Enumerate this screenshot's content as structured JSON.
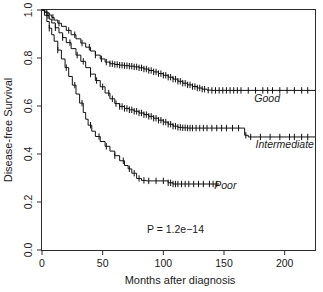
{
  "chart_data": {
    "type": "line",
    "title": "",
    "subtitle": "",
    "xlabel": "Months after diagnosis",
    "ylabel": "Disease-free Survival",
    "xlim": [
      0,
      225
    ],
    "ylim": [
      0.0,
      1.0
    ],
    "xticks": [
      0,
      50,
      100,
      150,
      200
    ],
    "xtick_labels": [
      "0",
      "50",
      "100",
      "150",
      "200"
    ],
    "yticks": [
      0.0,
      0.2,
      0.4,
      0.6,
      0.8,
      1.0
    ],
    "ytick_labels": [
      "0.0",
      "0.2",
      "0.4",
      "0.6",
      "0.8",
      "1.0"
    ],
    "grid": false,
    "legend_position": "inline-right-of-curve",
    "annotations": [
      {
        "name": "p-value",
        "text": "P = 1.2e−14",
        "x": 110,
        "y": 0.07
      }
    ],
    "series": [
      {
        "name": "Good",
        "label": "Good",
        "color": "#111111",
        "label_x": 175,
        "label_y": 0.615,
        "plateau_value": 0.665,
        "points": [
          [
            0,
            1.0
          ],
          [
            2,
            0.995
          ],
          [
            4,
            0.988
          ],
          [
            6,
            0.979
          ],
          [
            8,
            0.969
          ],
          [
            10,
            0.958
          ],
          [
            13,
            0.945
          ],
          [
            16,
            0.932
          ],
          [
            20,
            0.915
          ],
          [
            24,
            0.897
          ],
          [
            28,
            0.88
          ],
          [
            32,
            0.862
          ],
          [
            36,
            0.845
          ],
          [
            40,
            0.829
          ],
          [
            44,
            0.812
          ],
          [
            48,
            0.796
          ],
          [
            52,
            0.783
          ],
          [
            56,
            0.776
          ],
          [
            60,
            0.773
          ],
          [
            64,
            0.77
          ],
          [
            68,
            0.768
          ],
          [
            72,
            0.766
          ],
          [
            76,
            0.763
          ],
          [
            80,
            0.759
          ],
          [
            84,
            0.754
          ],
          [
            88,
            0.748
          ],
          [
            92,
            0.742
          ],
          [
            96,
            0.735
          ],
          [
            100,
            0.728
          ],
          [
            104,
            0.72
          ],
          [
            108,
            0.712
          ],
          [
            112,
            0.703
          ],
          [
            116,
            0.695
          ],
          [
            120,
            0.688
          ],
          [
            124,
            0.681
          ],
          [
            128,
            0.675
          ],
          [
            132,
            0.67
          ],
          [
            136,
            0.666
          ],
          [
            140,
            0.665
          ],
          [
            225,
            0.665
          ]
        ],
        "censor_x": [
          4,
          9,
          14,
          22,
          27,
          33,
          39,
          44,
          49,
          53,
          56,
          58,
          60,
          62,
          64,
          66,
          68,
          70,
          72,
          74,
          76,
          78,
          80,
          82,
          84,
          86,
          88,
          90,
          92,
          94,
          96,
          98,
          100,
          102,
          104,
          106,
          108,
          110,
          112,
          114,
          116,
          118,
          120,
          122,
          124,
          126,
          128,
          130,
          132,
          134,
          137,
          140,
          143,
          146,
          149,
          152,
          155,
          158,
          161,
          164,
          170,
          176,
          182,
          186,
          190,
          196,
          202,
          208,
          214,
          219
        ]
      },
      {
        "name": "Intermediate",
        "label": "Intermediate",
        "color": "#111111",
        "label_x": 176,
        "label_y": 0.425,
        "plateau_value": 0.471,
        "points": [
          [
            0,
            1.0
          ],
          [
            2,
            0.99
          ],
          [
            4,
            0.977
          ],
          [
            6,
            0.962
          ],
          [
            8,
            0.946
          ],
          [
            11,
            0.926
          ],
          [
            14,
            0.905
          ],
          [
            17,
            0.885
          ],
          [
            20,
            0.864
          ],
          [
            24,
            0.839
          ],
          [
            28,
            0.812
          ],
          [
            32,
            0.786
          ],
          [
            36,
            0.76
          ],
          [
            40,
            0.733
          ],
          [
            44,
            0.706
          ],
          [
            48,
            0.68
          ],
          [
            52,
            0.654
          ],
          [
            56,
            0.63
          ],
          [
            60,
            0.61
          ],
          [
            64,
            0.598
          ],
          [
            68,
            0.59
          ],
          [
            72,
            0.584
          ],
          [
            76,
            0.578
          ],
          [
            80,
            0.571
          ],
          [
            84,
            0.564
          ],
          [
            88,
            0.557
          ],
          [
            92,
            0.549
          ],
          [
            96,
            0.541
          ],
          [
            100,
            0.533
          ],
          [
            104,
            0.524
          ],
          [
            108,
            0.516
          ],
          [
            112,
            0.511
          ],
          [
            116,
            0.509
          ],
          [
            120,
            0.508
          ],
          [
            124,
            0.508
          ],
          [
            165,
            0.508
          ],
          [
            167,
            0.478
          ],
          [
            170,
            0.471
          ],
          [
            225,
            0.471
          ]
        ],
        "censor_x": [
          5,
          11,
          17,
          23,
          29,
          34,
          40,
          45,
          50,
          55,
          58,
          61,
          64,
          66,
          68,
          70,
          72,
          74,
          76,
          78,
          80,
          82,
          84,
          86,
          88,
          90,
          92,
          94,
          96,
          98,
          100,
          102,
          104,
          106,
          108,
          110,
          112,
          114,
          116,
          118,
          120,
          122,
          124,
          127,
          130,
          133,
          136,
          140,
          144,
          148,
          152,
          157,
          162,
          168,
          172,
          180,
          188,
          196,
          204,
          208,
          214,
          219
        ]
      },
      {
        "name": "Poor",
        "label": "Poor",
        "color": "#111111",
        "label_x": 142,
        "label_y": 0.255,
        "plateau_value": 0.275,
        "points": [
          [
            0,
            1.0
          ],
          [
            2,
            0.978
          ],
          [
            4,
            0.952
          ],
          [
            6,
            0.924
          ],
          [
            8,
            0.897
          ],
          [
            10,
            0.87
          ],
          [
            13,
            0.833
          ],
          [
            16,
            0.796
          ],
          [
            19,
            0.76
          ],
          [
            22,
            0.723
          ],
          [
            25,
            0.687
          ],
          [
            28,
            0.65
          ],
          [
            31,
            0.612
          ],
          [
            34,
            0.573
          ],
          [
            36,
            0.545
          ],
          [
            38,
            0.52
          ],
          [
            41,
            0.495
          ],
          [
            44,
            0.473
          ],
          [
            48,
            0.452
          ],
          [
            52,
            0.432
          ],
          [
            56,
            0.412
          ],
          [
            60,
            0.393
          ],
          [
            64,
            0.372
          ],
          [
            68,
            0.352
          ],
          [
            71,
            0.338
          ],
          [
            74,
            0.32
          ],
          [
            78,
            0.298
          ],
          [
            82,
            0.29
          ],
          [
            86,
            0.288
          ],
          [
            92,
            0.288
          ],
          [
            100,
            0.288
          ],
          [
            104,
            0.28
          ],
          [
            108,
            0.275
          ],
          [
            146,
            0.275
          ]
        ],
        "censor_x": [
          6,
          13,
          20,
          27,
          33,
          40,
          47,
          53,
          60,
          67,
          72,
          76,
          80,
          84,
          88,
          94,
          100,
          104,
          106,
          108,
          110,
          112,
          115,
          118,
          121,
          125,
          129,
          133,
          138,
          141,
          144
        ]
      }
    ]
  },
  "axes": {
    "x_label": "Months after diagnosis",
    "y_label": "Disease-free Survival"
  }
}
